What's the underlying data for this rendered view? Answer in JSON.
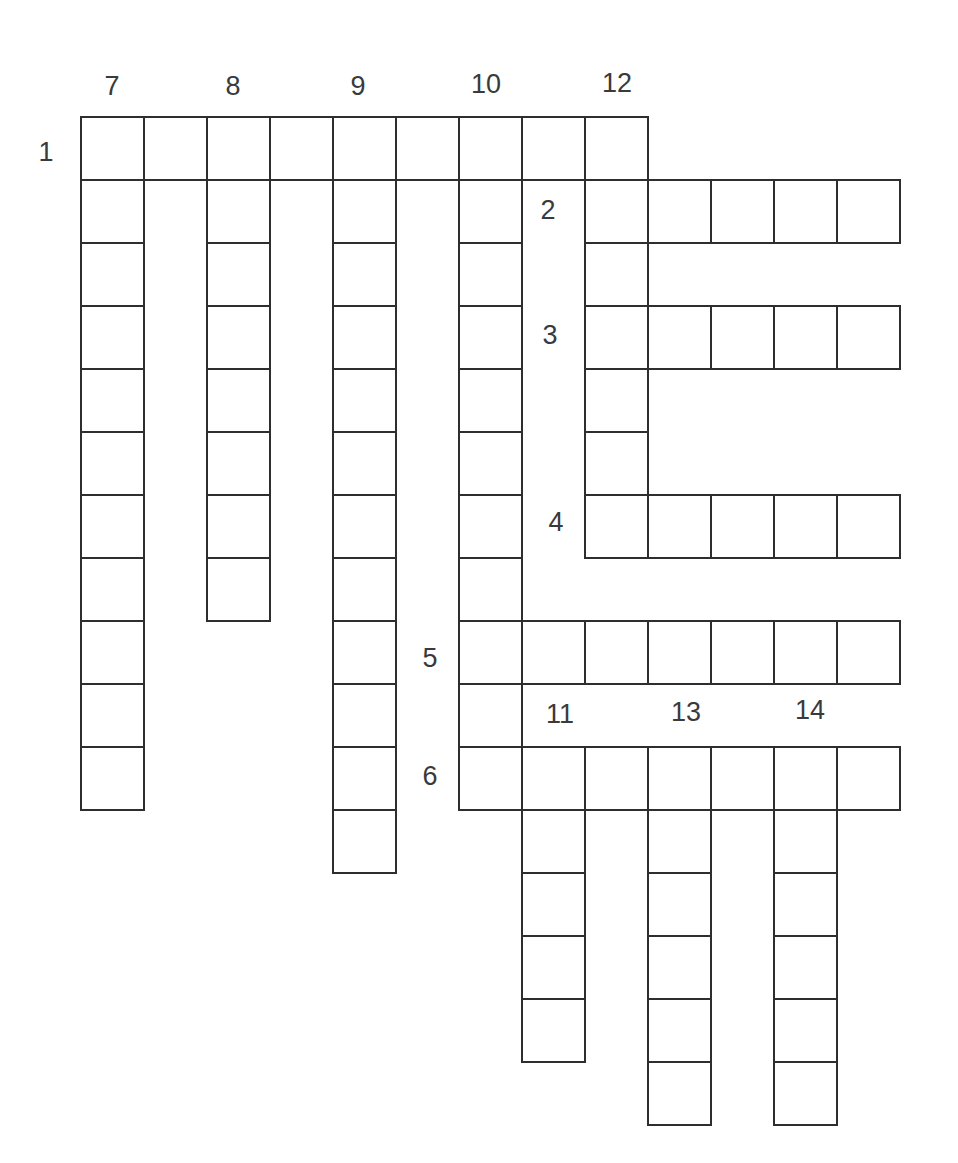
{
  "puzzle": {
    "type": "crossword",
    "grid": {
      "origin_x": 80,
      "origin_y": 116,
      "cell_size": 63
    },
    "entries": [
      {
        "number": "1",
        "direction": "across",
        "row": 0,
        "col": 0,
        "length": 9
      },
      {
        "number": "2",
        "direction": "across",
        "row": 1,
        "col": 8,
        "length": 5
      },
      {
        "number": "3",
        "direction": "across",
        "row": 3,
        "col": 8,
        "length": 5
      },
      {
        "number": "4",
        "direction": "across",
        "row": 6,
        "col": 8,
        "length": 5
      },
      {
        "number": "5",
        "direction": "across",
        "row": 8,
        "col": 6,
        "length": 7
      },
      {
        "number": "6",
        "direction": "across",
        "row": 10,
        "col": 6,
        "length": 7
      },
      {
        "number": "7",
        "direction": "down",
        "row": 0,
        "col": 0,
        "length": 11
      },
      {
        "number": "8",
        "direction": "down",
        "row": 0,
        "col": 2,
        "length": 8
      },
      {
        "number": "9",
        "direction": "down",
        "row": 0,
        "col": 4,
        "length": 12
      },
      {
        "number": "10",
        "direction": "down",
        "row": 0,
        "col": 6,
        "length": 11
      },
      {
        "number": "11",
        "direction": "down",
        "row": 10,
        "col": 7,
        "length": 5
      },
      {
        "number": "12",
        "direction": "down",
        "row": 0,
        "col": 8,
        "length": 7
      },
      {
        "number": "13",
        "direction": "down",
        "row": 10,
        "col": 9,
        "length": 6
      },
      {
        "number": "14",
        "direction": "down",
        "row": 10,
        "col": 11,
        "length": 6
      }
    ],
    "labels": [
      {
        "text": "1",
        "x": 46,
        "y": 152
      },
      {
        "text": "7",
        "x": 112,
        "y": 86
      },
      {
        "text": "8",
        "x": 233,
        "y": 86
      },
      {
        "text": "9",
        "x": 358,
        "y": 86
      },
      {
        "text": "10",
        "x": 486,
        "y": 84
      },
      {
        "text": "12",
        "x": 617,
        "y": 83
      },
      {
        "text": "2",
        "x": 548,
        "y": 210
      },
      {
        "text": "3",
        "x": 550,
        "y": 335
      },
      {
        "text": "4",
        "x": 556,
        "y": 522
      },
      {
        "text": "5",
        "x": 430,
        "y": 658
      },
      {
        "text": "6",
        "x": 430,
        "y": 776
      },
      {
        "text": "11",
        "x": 560,
        "y": 714
      },
      {
        "text": "13",
        "x": 686,
        "y": 712
      },
      {
        "text": "14",
        "x": 810,
        "y": 710
      }
    ],
    "colors": {
      "stroke": "#2e2e2e",
      "label": "#3a3a3a",
      "cell_fill": "#ffffff",
      "background": "#ffffff"
    }
  }
}
